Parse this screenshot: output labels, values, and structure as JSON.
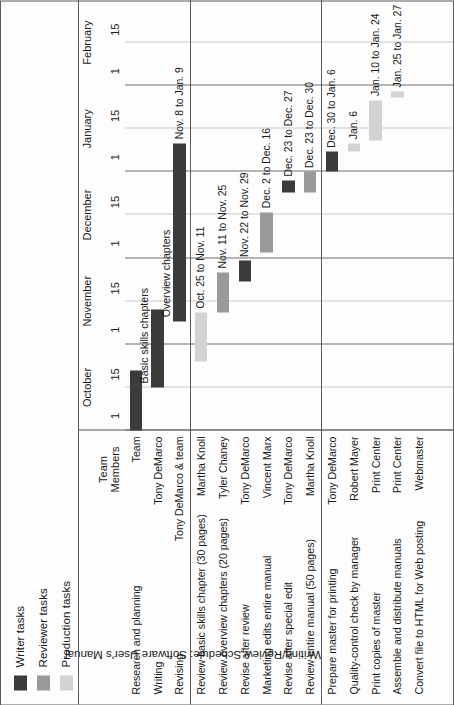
{
  "title": "Writing/Review Schedule: Software User's Manual",
  "colors": {
    "writer": "#3b3b3b",
    "reviewer": "#9a9a9a",
    "production": "#d3d3d3",
    "grid": "#8d8d8d",
    "border": "#5a5a5a"
  },
  "legend": {
    "items": [
      {
        "label": "Writer tasks",
        "color": "#3b3b3b",
        "key": "writer"
      },
      {
        "label": "Reviewer tasks",
        "color": "#9a9a9a",
        "key": "reviewer"
      },
      {
        "label": "Production tasks",
        "color": "#d3d3d3",
        "key": "production"
      }
    ]
  },
  "columns": {
    "task_header": "",
    "team_header_line1": "Team",
    "team_header_line2": "Members"
  },
  "chart_data": {
    "type": "bar",
    "subtype": "gantt",
    "title": "Writing/Review Schedule: Software User's Manual",
    "xlabel": "",
    "ylabel": "",
    "grid": true,
    "legend_position": "top-left",
    "axis": {
      "months": [
        {
          "name": "October",
          "ticks": [
            "1",
            "15"
          ]
        },
        {
          "name": "November",
          "ticks": [
            "1",
            "15"
          ]
        },
        {
          "name": "December",
          "ticks": [
            "1",
            "15"
          ]
        },
        {
          "name": "January",
          "ticks": [
            "1",
            "15"
          ]
        },
        {
          "name": "February",
          "ticks": [
            "1",
            "15"
          ]
        }
      ],
      "range_start": "Oct 1",
      "range_end": "Feb 15"
    },
    "groups": [
      {
        "name": "writing",
        "tasks": [
          {
            "task": "Research and planning",
            "member": "Team",
            "series": "writer",
            "start_day": 1,
            "end_day": 22,
            "inline_label": "",
            "date_label": ""
          },
          {
            "task": "Writing",
            "member": "Tony DeMarco",
            "series": "writer",
            "start_day": 16,
            "end_day": 43,
            "inline_label": "Basic skills chapters",
            "date_label": ""
          },
          {
            "task": "Revising",
            "member": "Tony DeMarco & team",
            "series": "writer",
            "start_day": 39,
            "end_day": 101,
            "inline_label": "Overview chapters",
            "date_label": "Nov. 8 to Jan. 9"
          }
        ]
      },
      {
        "name": "review",
        "tasks": [
          {
            "task": "Review basic skills chapter (30 pages)",
            "member": "Martha Knoll",
            "series": "production",
            "start_day": 25,
            "end_day": 42,
            "inline_label": "",
            "date_label": "Oct. 25 to Nov. 11"
          },
          {
            "task": "Review overview chapters (20 pages)",
            "member": "Tyler Chaney",
            "series": "reviewer",
            "start_day": 42,
            "end_day": 56,
            "inline_label": "",
            "date_label": "Nov. 11 to Nov. 25"
          },
          {
            "task": "Revise after review",
            "member": "Tony DeMarco",
            "series": "writer",
            "start_day": 53,
            "end_day": 60,
            "inline_label": "",
            "date_label": "Nov. 22 to Nov. 29"
          },
          {
            "task": "Marketing edits entire manual",
            "member": "Vincent Marx",
            "series": "reviewer",
            "start_day": 63,
            "end_day": 77,
            "inline_label": "",
            "date_label": "Dec. 2 to Dec. 16"
          },
          {
            "task": "Revise after special edit",
            "member": "Tony DeMarco",
            "series": "writer",
            "start_day": 84,
            "end_day": 88,
            "inline_label": "",
            "date_label": "Dec. 23 to Dec. 27"
          },
          {
            "task": "Review entire manual (50 pages)",
            "member": "Martha Knoll",
            "series": "reviewer",
            "start_day": 84,
            "end_day": 91,
            "inline_label": "",
            "date_label": "Dec. 23 to Dec. 30"
          }
        ]
      },
      {
        "name": "production",
        "tasks": [
          {
            "task": "Prepare master for printing",
            "member": "Tony DeMarco",
            "series": "writer",
            "start_day": 91,
            "end_day": 98,
            "inline_label": "",
            "date_label": "Dec. 30 to Jan. 6"
          },
          {
            "task": "Quality-control check by manager",
            "member": "Robert Mayer",
            "series": "production",
            "start_day": 98,
            "end_day": 101,
            "inline_label": "",
            "date_label": "Jan. 6"
          },
          {
            "task": "Print copies of master",
            "member": "Print Center",
            "series": "production",
            "start_day": 102,
            "end_day": 116,
            "inline_label": "",
            "date_label": "Jan. 10 to Jan. 24"
          },
          {
            "task": "Assemble and distribute manuals",
            "member": "Print Center",
            "series": "production",
            "start_day": 117,
            "end_day": 119,
            "inline_label": "",
            "date_label": "Jan. 25 to Jan. 27"
          },
          {
            "task": "Convert file to HTML for Web posting",
            "member": "Webmaster",
            "series": "production",
            "start_day": 0,
            "end_day": 0,
            "inline_label": "",
            "date_label": ""
          }
        ]
      }
    ]
  }
}
